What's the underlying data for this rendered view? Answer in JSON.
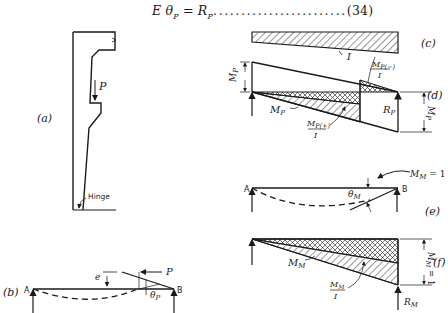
{
  "equation": {
    "lhs": "E θ",
    "lhs_sub": "P",
    "equals": " = ",
    "rhs": "R",
    "rhs_sub": "P",
    "leader": "........................",
    "number": "(34)"
  },
  "panels": {
    "a": {
      "tag": "(a)",
      "load": "P",
      "hinge_label": "Hinge"
    },
    "b": {
      "tag": "(b)",
      "left_support": "A",
      "right_support": "B",
      "load": "P",
      "eccentricity": "e",
      "rotation": "θ",
      "rotation_sub": "P"
    },
    "c": {
      "tag": "(c)",
      "inertia": "I"
    },
    "d": {
      "tag": "(d)",
      "moment": "M",
      "moment_sub": "P",
      "neg_ratio_num": "M",
      "neg_ratio_sub": "P(−)",
      "ratio_den": "I",
      "pos_ratio_num": "M",
      "pos_ratio_sub": "P(+)",
      "reaction": "R",
      "reaction_sub": "P",
      "left_dim": "M",
      "left_dim_sub": "P",
      "right_dim": "M",
      "right_dim_sub": "P"
    },
    "e": {
      "tag": "(e)",
      "left_support": "A",
      "right_support": "B",
      "unit_moment": "M",
      "unit_moment_sub": "M",
      "unit_moment_val": " = 1",
      "rotation": "θ",
      "rotation_sub": "M"
    },
    "f": {
      "tag": "(f)",
      "moment": "M",
      "moment_sub": "M",
      "ratio_num": "M",
      "ratio_sub": "M",
      "ratio_den": "I",
      "reaction": "R",
      "reaction_sub": "M",
      "right_dim": "M",
      "right_dim_sub": "M",
      "right_dim_val": " = 1"
    }
  }
}
